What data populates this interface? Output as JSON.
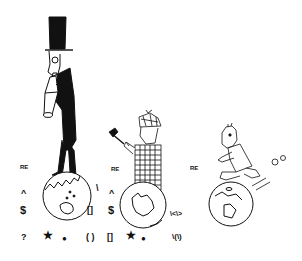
{
  "illustration": {
    "description": "Three cartoon figures on globes surrounded by regular-expression symbols",
    "figures": [
      {
        "name": "top-hat-man-with-telescope"
      },
      {
        "name": "detective-with-magnifying-glass"
      },
      {
        "name": "running-man"
      }
    ],
    "groups": [
      {
        "re": "RE",
        "caret": "^",
        "dollar": "$",
        "question": "?",
        "star": "★",
        "dot": "●",
        "backslash": "\\",
        "brackets": "[]",
        "parens": "( )"
      },
      {
        "re": "RE",
        "caret": "^",
        "dollar": "$",
        "brackets": "[]",
        "star": "★",
        "dot": "●",
        "word_boundary": "\\<\\>",
        "group_escape": "\\(\\)"
      },
      {
        "re": "RE"
      }
    ]
  }
}
